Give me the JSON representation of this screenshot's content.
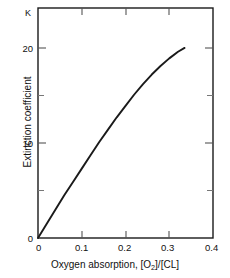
{
  "chart_data": {
    "type": "line",
    "title": "",
    "annotation": "K",
    "xlabel": "Oxygen absorption, [O2]/[CL]",
    "xlabel_parts": {
      "prefix": "Oxygen absorption, [O",
      "subscript": "2",
      "suffix": "]/[CL]"
    },
    "ylabel": "Extinction coefficient",
    "xlim": [
      0,
      0.4
    ],
    "ylim": [
      0,
      24.2
    ],
    "grid": false,
    "legend": null,
    "x_ticks": [
      0,
      0.1,
      0.2,
      0.3,
      0.4
    ],
    "x_tick_labels": [
      "0",
      "0.1",
      "0.2",
      "0.3",
      "0.4"
    ],
    "y_ticks": [
      0,
      10,
      20
    ],
    "y_tick_labels": [
      "0",
      "10",
      "20"
    ],
    "y_minor_ticks": [
      5,
      15
    ],
    "series": [
      {
        "name": "extinction coefficient",
        "color": "#1a1a1a",
        "x": [
          0,
          0.02,
          0.04,
          0.06,
          0.08,
          0.1,
          0.12,
          0.14,
          0.16,
          0.18,
          0.2,
          0.22,
          0.24,
          0.26,
          0.28,
          0.3,
          0.32,
          0.335
        ],
        "values": [
          0,
          1.5,
          3.0,
          4.5,
          5.9,
          7.3,
          8.7,
          10.1,
          11.4,
          12.7,
          13.9,
          15.1,
          16.2,
          17.2,
          18.1,
          18.9,
          19.6,
          20.0
        ]
      }
    ]
  },
  "axes": {
    "frame_color": "#1a1a1a",
    "tick_color": "#555555"
  }
}
